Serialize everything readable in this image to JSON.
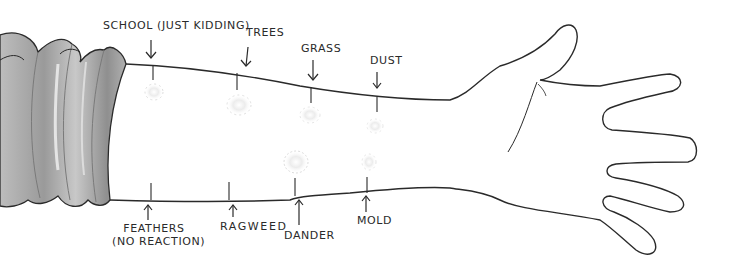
{
  "illustration": {
    "subject": "arm with allergy skin test marks",
    "colors": {
      "ink": "#2a2a2a",
      "sleeve_light": "#cfcfcf",
      "sleeve_dark": "#8e8e8e",
      "welt": "#e6e6e6",
      "background": "#ffffff"
    },
    "top_labels": [
      {
        "text": "SCHOOL (JUST KIDDING)",
        "arrow": "down"
      },
      {
        "text": "TREES",
        "arrow": "down"
      },
      {
        "text": "GRASS",
        "arrow": "down"
      },
      {
        "text": "DUST",
        "arrow": "down"
      }
    ],
    "bottom_labels": [
      {
        "text": "FEATHERS",
        "subtext": "(NO REACTION)",
        "arrow": "up"
      },
      {
        "text": "RAGWEED",
        "arrow": "up"
      },
      {
        "text": "DANDER",
        "arrow": "up"
      },
      {
        "text": "MOLD",
        "arrow": "up"
      }
    ]
  }
}
